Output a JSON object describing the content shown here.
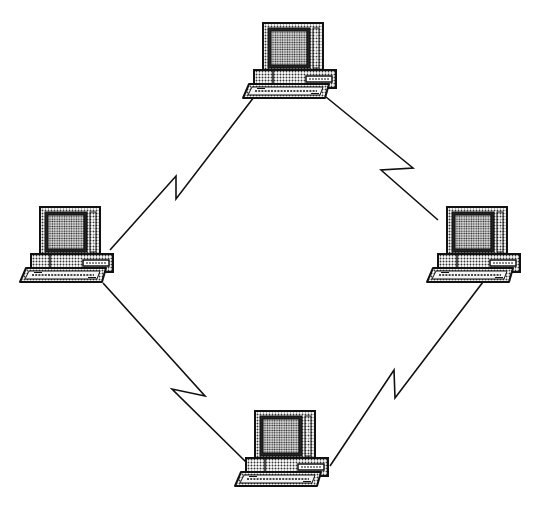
{
  "diagram": {
    "type": "ring-network-topology",
    "background": "#ffffff",
    "line_color": "#111111",
    "nodes": [
      {
        "id": "top",
        "label": "",
        "icon": "desktop-computer-icon",
        "x": 243,
        "y": 23
      },
      {
        "id": "left",
        "label": "",
        "icon": "desktop-computer-icon",
        "x": 20,
        "y": 206
      },
      {
        "id": "right",
        "label": "",
        "icon": "desktop-computer-icon",
        "x": 427,
        "y": 206
      },
      {
        "id": "bottom",
        "label": "",
        "icon": "desktop-computer-icon",
        "x": 235,
        "y": 410
      }
    ],
    "links": [
      {
        "from": "left",
        "to": "top",
        "style": "lightning-zigzag",
        "points": [
          [
            110,
            250
          ],
          [
            176,
            176
          ],
          [
            176,
            199
          ],
          [
            254,
            97
          ]
        ]
      },
      {
        "from": "top",
        "to": "right",
        "style": "lightning-zigzag",
        "points": [
          [
            326,
            97
          ],
          [
            413,
            168
          ],
          [
            381,
            170
          ],
          [
            438,
            220
          ]
        ]
      },
      {
        "from": "left",
        "to": "bottom",
        "style": "lightning-zigzag",
        "points": [
          [
            103,
            283
          ],
          [
            205,
            396
          ],
          [
            172,
            389
          ],
          [
            247,
            463
          ]
        ]
      },
      {
        "from": "right",
        "to": "bottom",
        "style": "lightning-zigzag",
        "points": [
          [
            483,
            282
          ],
          [
            395,
            398
          ],
          [
            394,
            370
          ],
          [
            330,
            466
          ]
        ]
      }
    ]
  }
}
